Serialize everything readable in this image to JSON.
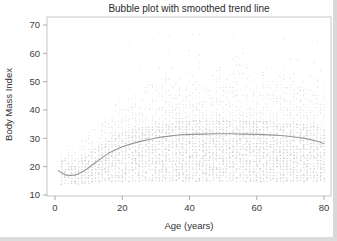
{
  "chart_data": {
    "type": "scatter",
    "title": "Bubble plot with smoothed trend line",
    "xlabel": "Age (years)",
    "ylabel": "Body Mass Index",
    "xlim": [
      -2.4,
      82
    ],
    "ylim": [
      10,
      72.8
    ],
    "x_ticks": [
      0,
      20,
      40,
      60,
      80
    ],
    "y_ticks": [
      10,
      20,
      30,
      40,
      50,
      60,
      70
    ],
    "grid": false,
    "legend": "none",
    "frame": true,
    "series": [
      {
        "name": "smoothed trend line",
        "type": "line",
        "points": [
          [
            1,
            18.6
          ],
          [
            2,
            17.8
          ],
          [
            3,
            17.2
          ],
          [
            4,
            16.9
          ],
          [
            5,
            16.9
          ],
          [
            6,
            17.1
          ],
          [
            7,
            17.5
          ],
          [
            8,
            18.1
          ],
          [
            9,
            18.8
          ],
          [
            10,
            19.6
          ],
          [
            12,
            21.4
          ],
          [
            14,
            23.2
          ],
          [
            16,
            24.8
          ],
          [
            18,
            26.0
          ],
          [
            20,
            27.0
          ],
          [
            22,
            27.8
          ],
          [
            24,
            28.5
          ],
          [
            26,
            29.1
          ],
          [
            28,
            29.6
          ],
          [
            30,
            30.1
          ],
          [
            32,
            30.5
          ],
          [
            34,
            30.8
          ],
          [
            36,
            31.1
          ],
          [
            38,
            31.3
          ],
          [
            40,
            31.4
          ],
          [
            44,
            31.5
          ],
          [
            48,
            31.6
          ],
          [
            52,
            31.6
          ],
          [
            56,
            31.5
          ],
          [
            60,
            31.4
          ],
          [
            64,
            31.2
          ],
          [
            68,
            30.9
          ],
          [
            72,
            30.4
          ],
          [
            75,
            29.8
          ],
          [
            78,
            29.0
          ],
          [
            80,
            28.2
          ]
        ]
      },
      {
        "name": "BMI bubbles",
        "type": "bubble-cloud",
        "description": "Tiny gray bubbles at each integer (age, BMI) cell; dense band from the floor BMI up to ~5 units above the trend, thinning upward to an age-dependent ceiling.",
        "generator": {
          "seed": 7,
          "age_min": 2,
          "age_max": 80,
          "bmi_floor_child": 13.5,
          "bmi_floor_adult": 15,
          "child_age_limit": 11,
          "top_base": 25,
          "top_slope": 1.3,
          "top_cap": 66,
          "outlier_max": 67,
          "outlier_prob": 0.05,
          "dense_prob": 0.93,
          "dense_above_trend": 5,
          "tail_exp": 1.7
        }
      }
    ],
    "colors": {
      "background": "#ffffff",
      "bubble_dense": "#cccccc",
      "bubble_tail": "#d6d6d6",
      "trend": "#979797",
      "frame": "#c6c6c6",
      "tick": "#aaaaaa",
      "tick_label": "#3d3d3d",
      "title_text": "#2b2b2b"
    }
  }
}
